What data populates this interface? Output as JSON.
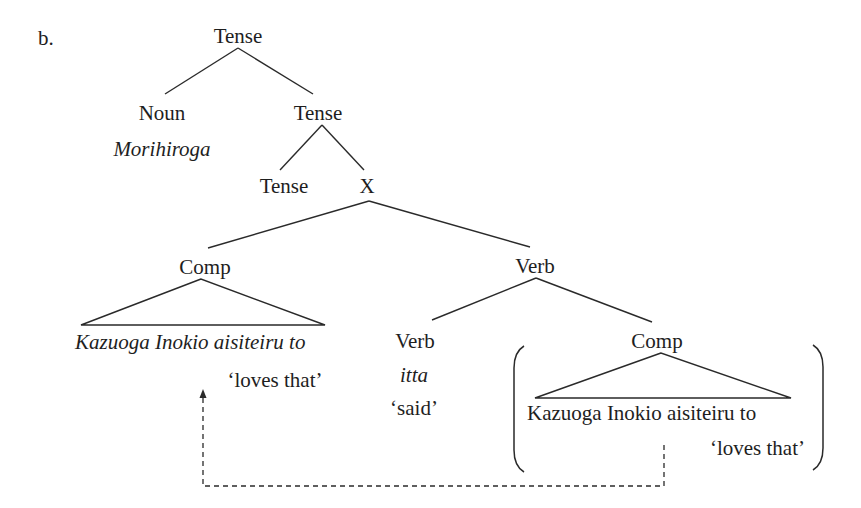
{
  "example_label": "b.",
  "tree": {
    "root": "Tense",
    "noun": {
      "label": "Noun",
      "word": "Morihiroga"
    },
    "tense_bar": "Tense",
    "tense_head": "Tense",
    "x_node": "X",
    "comp_left": {
      "label": "Comp",
      "text": "Kazuoga Inokio aisiteiru to",
      "gloss": "‘loves that’"
    },
    "verb_phrase": "Verb",
    "verb_head": {
      "label": "Verb",
      "word": "itta",
      "gloss": "‘said’"
    },
    "comp_right": {
      "label": "Comp",
      "text": "Kazuoga Inokio aisiteiru to",
      "gloss": "‘loves that’"
    }
  },
  "movement_arrow": {
    "style": "dashed",
    "from": "comp_right",
    "to": "comp_left"
  }
}
